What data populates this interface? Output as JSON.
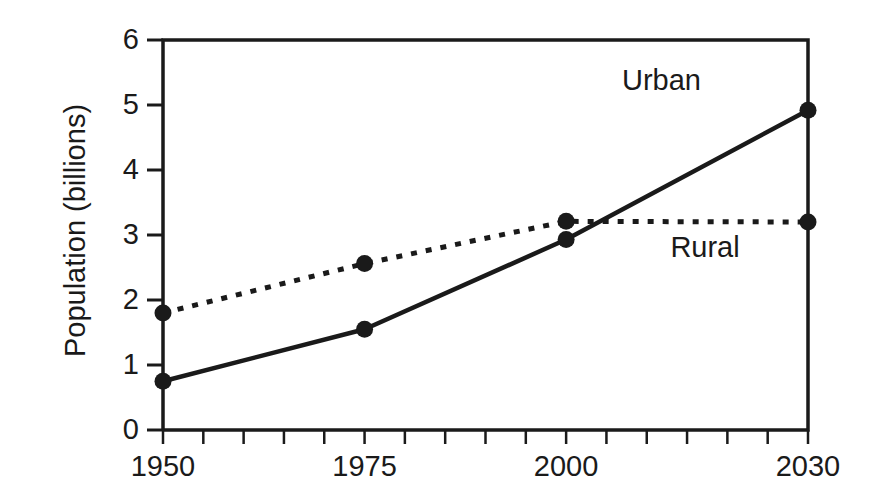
{
  "chart_data": {
    "type": "line",
    "title": "",
    "subtitle": "",
    "xlabel": "",
    "ylabel": "Population (billions)",
    "x": [
      1950,
      1975,
      2000,
      2030
    ],
    "xlim": [
      1950,
      2030
    ],
    "ylim": [
      0,
      6
    ],
    "grid": false,
    "legend_position": "inline-annotation",
    "xticks": [
      1950,
      1975,
      2000,
      2030
    ],
    "xtick_labels": [
      "1950",
      "1975",
      "2000",
      "2030"
    ],
    "xminor_tick_step": 5,
    "yticks": [
      0,
      1,
      2,
      3,
      4,
      5,
      6
    ],
    "ytick_labels": [
      "0",
      "1",
      "2",
      "3",
      "4",
      "5",
      "6"
    ],
    "series": [
      {
        "name": "Urban",
        "label": "Urban",
        "style": "solid",
        "color": "#1a1a1a",
        "marker": "circle",
        "values": [
          0.75,
          1.55,
          2.93,
          4.92
        ]
      },
      {
        "name": "Rural",
        "label": "Rural",
        "style": "dotted",
        "color": "#1a1a1a",
        "marker": "circle",
        "values": [
          1.8,
          2.56,
          3.21,
          3.2
        ]
      }
    ],
    "annotations": [
      {
        "text": "Urban",
        "x": 2014,
        "y": 5.35
      },
      {
        "text": "Rural",
        "x": 2020,
        "y": 2.78
      }
    ]
  },
  "axes": {
    "frame_color": "#1a1a1a",
    "background": "#ffffff"
  }
}
